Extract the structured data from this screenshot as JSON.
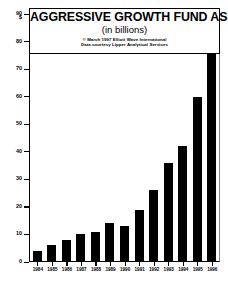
{
  "chart_data": {
    "type": "bar",
    "title": "AGGRESSIVE GROWTH FUND ASSETS",
    "subtitle": "(in billions)",
    "credits": [
      "© March 1997 Elliott Wave International",
      "Data courtesy Lipper Analytical Services"
    ],
    "xlabel": "",
    "ylabel": "$",
    "categories": [
      "1984",
      "1985",
      "1986",
      "1987",
      "1988",
      "1989",
      "1990",
      "1991",
      "1992",
      "1993",
      "1994",
      "1995",
      "1996"
    ],
    "values": [
      4,
      6,
      8,
      10,
      11,
      14,
      13,
      19,
      26,
      36,
      42,
      60,
      85
    ],
    "ylim": [
      0,
      90
    ],
    "ytick_labels": [
      "0",
      "10",
      "20",
      "30",
      "40",
      "50",
      "60",
      "70",
      "80",
      "90"
    ],
    "ytick_values": [
      0,
      10,
      20,
      30,
      40,
      50,
      60,
      70,
      80,
      90
    ],
    "grid": false,
    "legend": false,
    "bar_color": "#000000",
    "background_color": "#ffffff",
    "axis_color": "#000000"
  }
}
